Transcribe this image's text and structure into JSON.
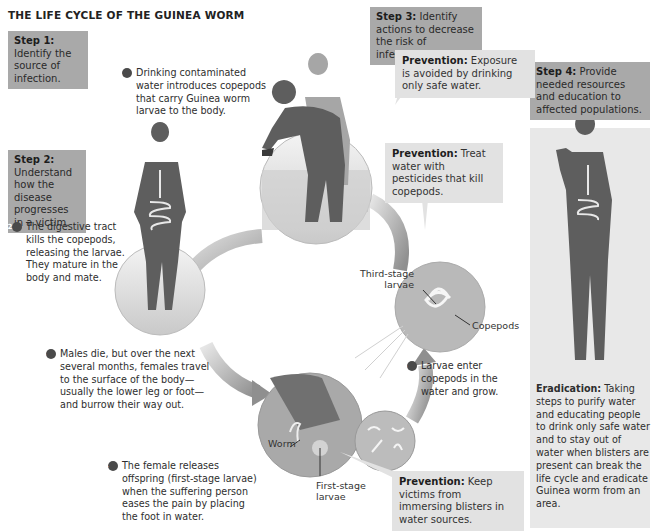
{
  "title": "THE LIFE CYCLE OF THE GUINEA WORM",
  "steps": [
    {
      "label": "Step 1:",
      "text": "Identify the source of infection."
    },
    {
      "label": "Step 2:",
      "text": "Understand how the disease progresses in a victim."
    },
    {
      "label": "Step 3:",
      "text": "Identify actions to decrease the risk of infection."
    },
    {
      "label": "Step 4:",
      "text": "Provide needed resources and education to affected populations."
    }
  ],
  "stages": [
    {
      "number": "1",
      "text": "Drinking contaminated water introduces copepods that carry Guinea worm larvae to the body."
    },
    {
      "number": "2",
      "text": "The digestive tract kills the copepods, releasing the larvae. They mature in the body and mate."
    },
    {
      "number": "3",
      "text": "Males die, but over the next several months, females travel to the surface of the body—usually the lower leg or foot—and burrow their way out."
    },
    {
      "number": "4",
      "text": "The female releases offspring (first-stage larvae) when the suffering person eases the pain by placing the foot in water."
    },
    {
      "number": "5",
      "text": "Larvae enter copepods in the water and grow."
    }
  ],
  "prevention": [
    {
      "label": "Prevention:",
      "text": "Exposure is avoided by drinking only safe water."
    },
    {
      "label": "Prevention:",
      "text": "Treat water with pesticides that kill copepods."
    },
    {
      "label": "Prevention:",
      "text": "Keep victims from immersing blisters in water sources."
    }
  ],
  "eradication": {
    "label": "Eradication:",
    "text": "Taking steps to purify water and educating people to drink only safe water and to stay out of water when blisters are present can break the life cycle and eradicate Guinea worm from an area."
  },
  "labels": {
    "third_stage": "Third-stage larvae",
    "copepods": "Copepods",
    "worm": "Worm",
    "first_stage": "First-stage larvae"
  },
  "colors": {
    "step_box": "#a9a9a9",
    "prevention_box": "#e2e2e2",
    "silhouette": "#6e6e6e",
    "arrow": "#bdbdbd"
  }
}
